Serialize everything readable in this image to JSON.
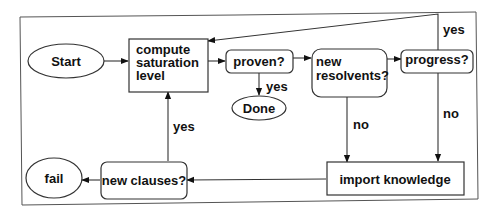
{
  "diagram": {
    "type": "flowchart",
    "nodes": {
      "start": {
        "label": "Start",
        "shape": "ellipse"
      },
      "compute": {
        "lines": [
          "compute",
          "saturation",
          "level"
        ],
        "shape": "rect"
      },
      "proven": {
        "label": "proven?",
        "shape": "rounded-rect"
      },
      "done": {
        "label": "Done",
        "shape": "ellipse"
      },
      "new_resolvents": {
        "lines": [
          "new",
          "resolvents?"
        ],
        "shape": "rounded-rect"
      },
      "progress": {
        "label": "progress?",
        "shape": "rounded-rect"
      },
      "import_knowledge": {
        "label": "import knowledge",
        "shape": "rect"
      },
      "new_clauses": {
        "label": "new clauses?",
        "shape": "rounded-rect"
      },
      "fail": {
        "label": "fail",
        "shape": "ellipse"
      }
    },
    "edges": [
      {
        "from": "start",
        "to": "compute",
        "label": ""
      },
      {
        "from": "compute",
        "to": "proven",
        "label": ""
      },
      {
        "from": "proven",
        "to": "done",
        "label": "yes"
      },
      {
        "from": "proven",
        "to": "new_resolvents",
        "label": ""
      },
      {
        "from": "new_resolvents",
        "to": "progress",
        "label": ""
      },
      {
        "from": "progress",
        "to": "compute",
        "label": "yes"
      },
      {
        "from": "new_resolvents",
        "to": "import_knowledge",
        "label": "no"
      },
      {
        "from": "progress",
        "to": "import_knowledge",
        "label": "no"
      },
      {
        "from": "import_knowledge",
        "to": "new_clauses",
        "label": ""
      },
      {
        "from": "new_clauses",
        "to": "compute",
        "label": "yes"
      },
      {
        "from": "new_clauses",
        "to": "fail",
        "label": ""
      }
    ],
    "edge_labels": {
      "proven_done": "yes",
      "progress_compute": "yes",
      "resolvents_import": "no",
      "progress_import": "no",
      "clauses_compute": "yes"
    }
  }
}
